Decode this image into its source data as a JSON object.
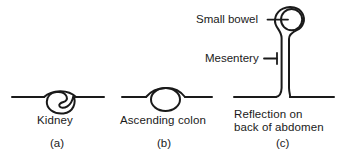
{
  "figure": {
    "type": "anatomical-line-diagram",
    "background_color": "#ffffff",
    "line_color": "#1a1a1a",
    "panels": [
      {
        "id": "a",
        "letter": "(a)",
        "caption": "Kidney",
        "structure": "kidney-retroperitoneal",
        "description": "Bean shaped organ with hilum notch on right, lying below the peritoneal line"
      },
      {
        "id": "b",
        "letter": "(b)",
        "caption": "Ascending colon",
        "structure": "ascending-colon",
        "description": "Oval bowel loop with peritoneum arching over it"
      },
      {
        "id": "c",
        "letter": "(c)",
        "caption_line_1": "Reflection on",
        "caption_line_2": "back of abdomen",
        "structure": "small-bowel-on-mesentery",
        "description": "Circular bowel suspended on a two layered mesentery descending to the posterior abdominal wall",
        "callouts": [
          {
            "id": "small-bowel",
            "label": "Small bowel"
          },
          {
            "id": "mesentery",
            "label": "Mesentery"
          }
        ]
      }
    ]
  }
}
